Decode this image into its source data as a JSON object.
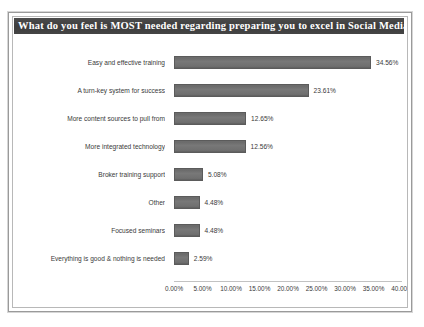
{
  "chart_data": {
    "type": "bar",
    "orientation": "horizontal",
    "title": "What do you feel is MOST needed regarding preparing you to excel in Social Media:",
    "xlabel": "",
    "ylabel": "",
    "xlim": [
      0,
      40
    ],
    "grid": false,
    "legend": "none",
    "bar_color": "#6f6f6f",
    "title_band_color": "#3f3f3f",
    "title_text_color": "#ffffff",
    "categories": [
      "Easy and effective training",
      "A turn-key system for success",
      "More content sources to pull from",
      "More integrated technology",
      "Broker training support",
      "Other",
      "Focused seminars",
      "Everything is good & nothing is needed"
    ],
    "values": [
      34.56,
      23.61,
      12.65,
      12.56,
      5.08,
      4.48,
      4.48,
      2.59
    ],
    "value_labels": [
      "34.56%",
      "23.61%",
      "12.65%",
      "12.56%",
      "5.08%",
      "4.48%",
      "4.48%",
      "2.59%"
    ],
    "xticks": [
      0,
      5,
      10,
      15,
      20,
      25,
      30,
      35,
      40
    ],
    "xtick_labels": [
      "0.00%",
      "5.00%",
      "10.00%",
      "15.00%",
      "20.00%",
      "25.00%",
      "30.00%",
      "35.00%",
      "40.00%"
    ]
  }
}
